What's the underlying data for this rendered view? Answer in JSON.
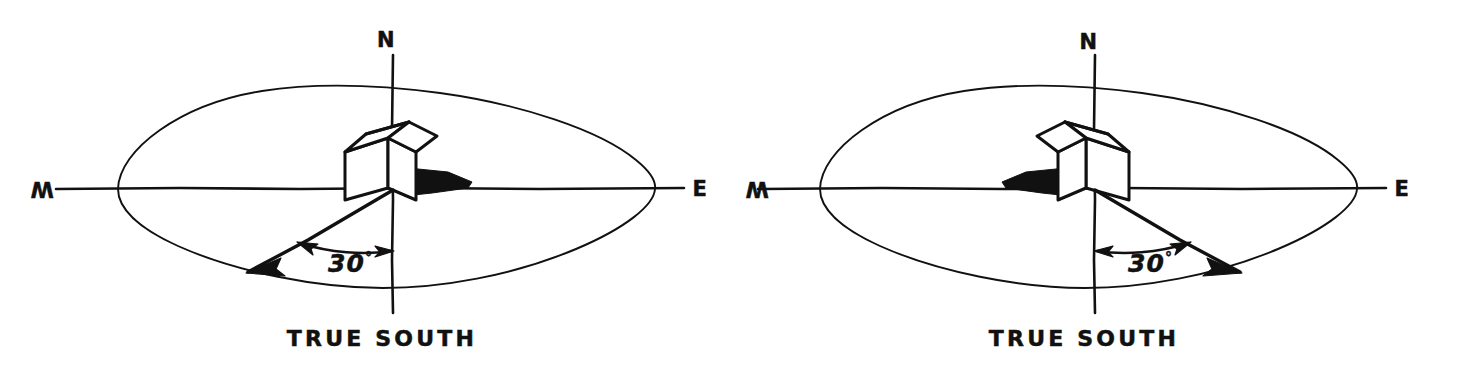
{
  "figure": {
    "background_color": "#ffffff",
    "ink_color": "#111111",
    "width": 1464,
    "height": 380
  },
  "diagrams": [
    {
      "id": "left",
      "name": "house-rotated-west-of-south",
      "rotation_direction": "west",
      "labels": {
        "north": "N",
        "west": "W",
        "east": "E",
        "caption": "TRUE  SOUTH",
        "angle": "30",
        "angle_unit": "°",
        "angle_full": "30°"
      },
      "geometry": {
        "center_x": 386,
        "center_y": 188,
        "ellipse_rx": 268,
        "ellipse_ry": 100,
        "axis_x_left": 56,
        "axis_x_right": 684,
        "axis_y_top": 55,
        "axis_y_bottom": 313,
        "azimuth_angle_deg": 30,
        "azimuth_length": 168
      }
    },
    {
      "id": "right",
      "name": "house-rotated-east-of-south",
      "rotation_direction": "east",
      "labels": {
        "north": "N",
        "west": "W",
        "east": "E",
        "caption": "TRUE  SOUTH",
        "angle": "30",
        "angle_unit": "°",
        "angle_full": "30°"
      },
      "geometry": {
        "center_x": 1088,
        "center_y": 188,
        "ellipse_rx": 268,
        "ellipse_ry": 100,
        "axis_x_left": 758,
        "axis_x_right": 1386,
        "axis_y_top": 55,
        "axis_y_bottom": 313,
        "azimuth_angle_deg": 30,
        "azimuth_length": 168
      }
    }
  ]
}
